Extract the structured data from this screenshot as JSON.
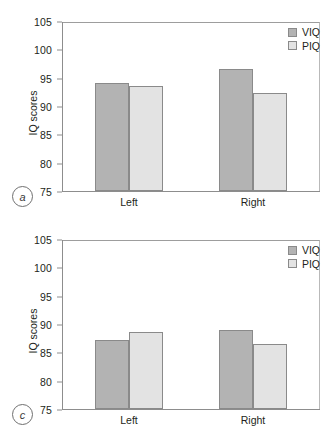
{
  "figure": {
    "panels": [
      {
        "tag": "a",
        "ylabel": "IQ scores",
        "yticks": [
          "105",
          "100",
          "95",
          "90",
          "85",
          "80",
          "75"
        ],
        "categories": [
          "Left",
          "Right"
        ],
        "legend": [
          {
            "label": "VIQ",
            "color": "#b3b3b3"
          },
          {
            "label": "PIQ",
            "color": "#e3e3e3"
          }
        ],
        "values": {
          "viq": [
            94.2,
            96.7
          ],
          "piq": [
            93.7,
            92.5
          ]
        }
      },
      {
        "tag": "c",
        "ylabel": "IQ scores",
        "yticks": [
          "105",
          "100",
          "95",
          "90",
          "85",
          "80",
          "75"
        ],
        "categories": [
          "Left",
          "Right"
        ],
        "legend": [
          {
            "label": "VIQ",
            "color": "#b3b3b3"
          },
          {
            "label": "PIQ",
            "color": "#e3e3e3"
          }
        ],
        "values": {
          "viq": [
            87.4,
            89.1
          ],
          "piq": [
            88.7,
            86.6
          ]
        }
      }
    ]
  },
  "chart_data": [
    {
      "type": "bar",
      "panel": "a",
      "title": "",
      "xlabel": "",
      "ylabel": "IQ scores",
      "categories": [
        "Left",
        "Right"
      ],
      "series": [
        {
          "name": "VIQ",
          "values": [
            94.2,
            96.7
          ],
          "color": "#b3b3b3"
        },
        {
          "name": "PIQ",
          "values": [
            93.7,
            92.5
          ],
          "color": "#e3e3e3"
        }
      ],
      "ylim": [
        75,
        105
      ],
      "ytick_step": 5,
      "grid": false,
      "legend_position": "top-right"
    },
    {
      "type": "bar",
      "panel": "c",
      "title": "",
      "xlabel": "",
      "ylabel": "IQ scores",
      "categories": [
        "Left",
        "Right"
      ],
      "series": [
        {
          "name": "VIQ",
          "values": [
            87.4,
            89.1
          ],
          "color": "#b3b3b3"
        },
        {
          "name": "PIQ",
          "values": [
            88.7,
            86.6
          ],
          "color": "#e3e3e3"
        }
      ],
      "ylim": [
        75,
        105
      ],
      "ytick_step": 5,
      "grid": false,
      "legend_position": "top-right"
    }
  ]
}
